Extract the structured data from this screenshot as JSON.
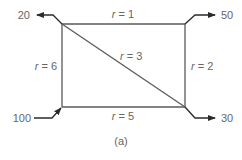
{
  "diagram": {
    "caption": "(a)",
    "edges": [
      {
        "id": "top",
        "label_var": "r",
        "label_eq": " = 1"
      },
      {
        "id": "left",
        "label_var": "r",
        "label_eq": " = 6"
      },
      {
        "id": "right",
        "label_var": "r",
        "label_eq": " = 2"
      },
      {
        "id": "bottom",
        "label_var": "r",
        "label_eq": " = 5"
      },
      {
        "id": "diagonal",
        "label_var": "r",
        "label_eq": " = 3"
      }
    ],
    "flows": [
      {
        "id": "out-top-left",
        "value": "20",
        "direction": "out"
      },
      {
        "id": "out-top-right",
        "value": "50",
        "direction": "out"
      },
      {
        "id": "out-bottom-right",
        "value": "30",
        "direction": "out"
      },
      {
        "id": "in-bottom-left",
        "value": "100",
        "direction": "in"
      }
    ],
    "colors": {
      "edge": "#5a5a5a",
      "arrow": "#2a2a2a",
      "text": "#666666"
    }
  }
}
